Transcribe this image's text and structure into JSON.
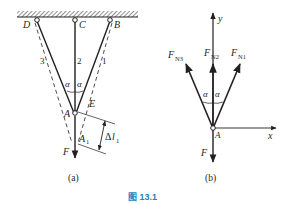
{
  "figure": {
    "caption": "图 13.1",
    "caption_color": "#2a7fc2",
    "ink_color": "#231f20"
  },
  "panel_a": {
    "sublabel": "(a)",
    "points": {
      "D": "D",
      "C": "C",
      "B": "B",
      "A": "A",
      "E": "E",
      "A1": "A",
      "A1_sub": "1"
    },
    "rods": {
      "rod1": "1",
      "rod2": "2",
      "rod3": "3"
    },
    "angle_left": "α",
    "angle_right": "α",
    "force": "F",
    "delta": {
      "prefix": "Δ",
      "var": "l",
      "sub": "1"
    }
  },
  "panel_b": {
    "sublabel": "(b)",
    "axis_y": "y",
    "axis_x": "x",
    "origin": "A",
    "forces": {
      "FN3": {
        "main": "F",
        "sub": "N3"
      },
      "FN2": {
        "main": "F",
        "sub": "N2"
      },
      "FN1": {
        "main": "F",
        "sub": "N1"
      },
      "F": "F"
    },
    "angle_left": "α",
    "angle_right": "α"
  }
}
